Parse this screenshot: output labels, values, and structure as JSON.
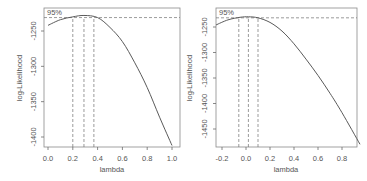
{
  "chart_data": [
    {
      "type": "line",
      "title": "",
      "xlabel": "lambda",
      "ylabel": "log-Likelihood",
      "xlim": [
        -0.02,
        1.02
      ],
      "ylim": [
        -1420,
        -1220
      ],
      "xticks": [
        "0.0",
        "0.2",
        "0.4",
        "0.6",
        "0.8",
        "1.0"
      ],
      "yticks": [
        "-1250",
        "-1300",
        "-1350",
        "-1400"
      ],
      "annotation": "95%",
      "ci_lines": {
        "lower": 0.2,
        "mle": 0.29,
        "upper": 0.37,
        "threshold": -1231
      },
      "x": [
        0.0,
        0.1,
        0.2,
        0.29,
        0.4,
        0.5,
        0.6,
        0.7,
        0.8,
        0.9,
        1.0
      ],
      "y": [
        -1242,
        -1234,
        -1230,
        -1228,
        -1231,
        -1245,
        -1265,
        -1295,
        -1330,
        -1372,
        -1412
      ],
      "grid": false
    },
    {
      "type": "line",
      "title": "",
      "xlabel": "lambda",
      "ylabel": "log-Likelihood",
      "xlim": [
        -0.26,
        0.98
      ],
      "ylim": [
        -1500,
        -1225
      ],
      "xticks": [
        "-0.2",
        "0.0",
        "0.2",
        "0.4",
        "0.6",
        "0.8"
      ],
      "yticks": [
        "-1250",
        "-1300",
        "-1350",
        "-1400",
        "-1450"
      ],
      "annotation": "95%",
      "ci_lines": {
        "lower": -0.06,
        "mle": 0.02,
        "upper": 0.1,
        "threshold": -1232
      },
      "x": [
        -0.25,
        -0.15,
        -0.05,
        0.02,
        0.1,
        0.2,
        0.3,
        0.4,
        0.5,
        0.6,
        0.7,
        0.8,
        0.95
      ],
      "y": [
        -1246,
        -1236,
        -1231,
        -1230,
        -1232,
        -1241,
        -1258,
        -1283,
        -1313,
        -1345,
        -1380,
        -1418,
        -1480
      ],
      "grid": false
    }
  ],
  "panels": [
    {
      "xlabel": "lambda",
      "ylabel": "log-Likelihood",
      "annotation": "95%"
    },
    {
      "xlabel": "lambda",
      "ylabel": "log-Likelihood",
      "annotation": "95%"
    }
  ]
}
